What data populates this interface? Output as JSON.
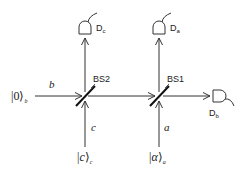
{
  "diagram": {
    "type": "optical-beam-splitter-setup",
    "beam_splitters": [
      {
        "id": "bs2",
        "label": "BS2"
      },
      {
        "id": "bs1",
        "label": "BS1"
      }
    ],
    "detectors": [
      {
        "id": "dc",
        "label": "D",
        "subscript": "c"
      },
      {
        "id": "da",
        "label": "D",
        "subscript": "a"
      },
      {
        "id": "db",
        "label": "D",
        "subscript": "b"
      }
    ],
    "modes": {
      "b": "b",
      "c": "c",
      "a": "a"
    },
    "input_states": {
      "zero_b": {
        "ket": "0",
        "subscript": "b"
      },
      "c_c": {
        "ket": "c",
        "subscript": "c"
      },
      "alpha_a": {
        "ket": "α",
        "subscript": "a"
      }
    },
    "colors": {
      "line": "#333333",
      "text": "#222222"
    }
  }
}
